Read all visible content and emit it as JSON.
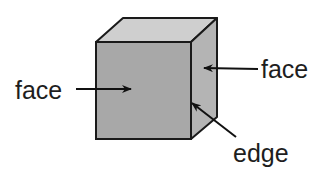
{
  "diagram": {
    "labels": {
      "front_face": "face",
      "side_face": "face",
      "edge": "edge"
    },
    "colors": {
      "front_face": "#a8a8a8",
      "side_face": "#b4b4b4",
      "top_face": "#cfcfcf",
      "outline": "#1a1a1a",
      "text": "#1e1e1e"
    }
  }
}
